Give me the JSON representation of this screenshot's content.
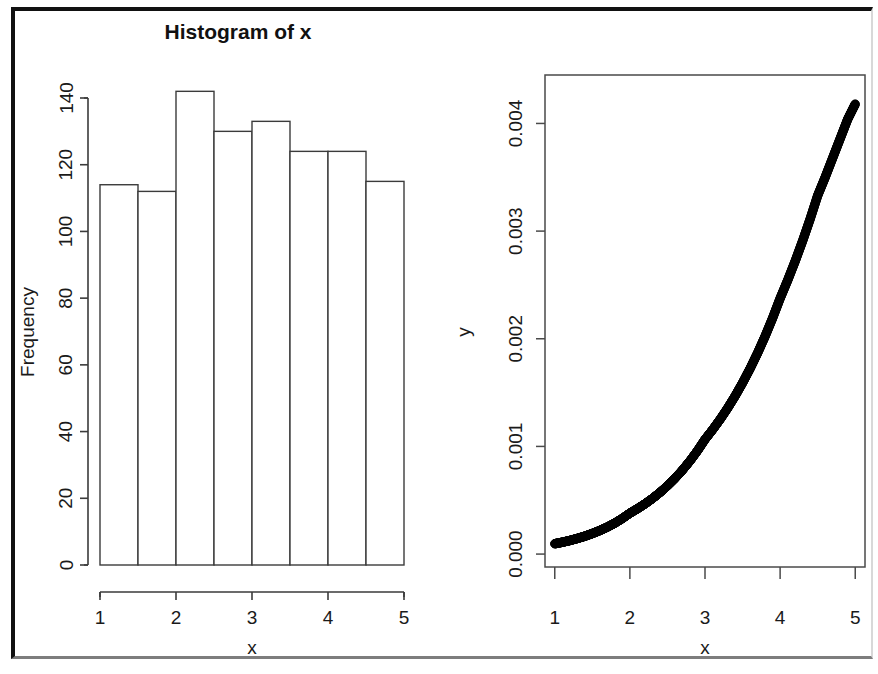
{
  "figure": {
    "background_color": "#ffffff",
    "frame_color": "#111111",
    "ink_color": "#1a1a1a",
    "panel_count": 2
  },
  "panels": {
    "left": {
      "name": "histogram-panel",
      "title": "Histogram of x",
      "x_axis_label": "x",
      "y_axis_label": "Frequency",
      "x_tick_labels": [
        "1",
        "2",
        "3",
        "4",
        "5"
      ],
      "y_tick_labels": [
        "0",
        "20",
        "40",
        "60",
        "80",
        "100",
        "120",
        "140"
      ]
    },
    "right": {
      "name": "scatter-panel",
      "title": "",
      "x_axis_label": "x",
      "y_axis_label": "y",
      "x_tick_labels": [
        "1",
        "2",
        "3",
        "4",
        "5"
      ],
      "y_tick_labels": [
        "0.000",
        "0.001",
        "0.002",
        "0.003",
        "0.004"
      ]
    }
  },
  "chart_data": [
    {
      "type": "bar",
      "name": "histogram-of-x",
      "title": "Histogram of x",
      "xlabel": "x",
      "ylabel": "Frequency",
      "xlim": [
        1,
        5
      ],
      "ylim": [
        0,
        145
      ],
      "grid": false,
      "legend": null,
      "bin_width": 0.5,
      "bin_edges": [
        1.0,
        1.5,
        2.0,
        2.5,
        3.0,
        3.5,
        4.0,
        4.5,
        5.0
      ],
      "categories": [
        "1.0-1.5",
        "1.5-2.0",
        "2.0-2.5",
        "2.5-3.0",
        "3.0-3.5",
        "3.5-4.0",
        "4.0-4.5",
        "4.5-5.0"
      ],
      "values": [
        114,
        112,
        142,
        130,
        133,
        124,
        124,
        115
      ],
      "x_ticks": [
        1,
        2,
        3,
        4,
        5
      ],
      "y_ticks": [
        0,
        20,
        40,
        60,
        80,
        100,
        120,
        140
      ],
      "total_count": 994
    },
    {
      "type": "scatter",
      "name": "y-versus-x",
      "title": "",
      "xlabel": "x",
      "ylabel": "y",
      "xlim": [
        0.87,
        5.13
      ],
      "ylim": [
        -0.00012,
        0.00445
      ],
      "grid": false,
      "legend": null,
      "marker": "open-circle",
      "x_ticks": [
        1,
        2,
        3,
        4,
        5
      ],
      "y_ticks": [
        0.0,
        0.001,
        0.002,
        0.003,
        0.004
      ],
      "x": [
        1.0,
        1.1,
        1.2,
        1.3,
        1.4,
        1.5,
        1.6,
        1.7,
        1.8,
        1.9,
        2.0,
        2.1,
        2.2,
        2.3,
        2.4,
        2.5,
        2.6,
        2.7,
        2.8,
        2.9,
        3.0,
        3.1,
        3.2,
        3.3,
        3.4,
        3.5,
        3.6,
        3.7,
        3.8,
        3.9,
        4.0,
        4.1,
        4.2,
        4.3,
        4.4,
        4.5,
        4.6,
        4.7,
        4.8,
        4.9,
        5.0
      ],
      "y": [
        9.6e-05,
        0.00011,
        0.000126,
        0.000145,
        0.000166,
        0.000191,
        0.000219,
        0.000251,
        0.000288,
        0.000331,
        0.00038,
        0.000421,
        0.000466,
        0.000516,
        0.000572,
        0.000634,
        0.000703,
        0.00078,
        0.000865,
        0.00096,
        0.001065,
        0.001154,
        0.00125,
        0.001354,
        0.001467,
        0.00159,
        0.001723,
        0.001867,
        0.002023,
        0.002192,
        0.002375,
        0.002542,
        0.00272,
        0.00291,
        0.003113,
        0.00333,
        0.0035,
        0.00368,
        0.00386,
        0.00404,
        0.00418
      ],
      "point_count": 41,
      "shape_note": "monotonic increasing convex curve"
    }
  ]
}
